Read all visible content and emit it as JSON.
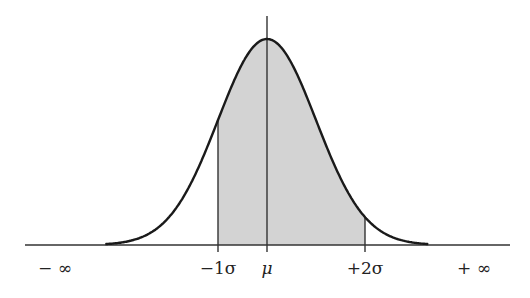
{
  "chart_data": {
    "type": "diagram",
    "distribution": "normal",
    "shaded_range": [
      "-1σ",
      "+2σ"
    ],
    "axis": {
      "labels": [
        {
          "text": "− ∞",
          "position": "left-end"
        },
        {
          "text": "−1σ",
          "position": -1
        },
        {
          "text": "μ",
          "position": 0
        },
        {
          "text": "+2σ",
          "position": 2
        },
        {
          "text": "+ ∞",
          "position": "right-end"
        }
      ],
      "vertical_lines_at": [
        -1,
        0,
        2
      ]
    },
    "colors": {
      "curve": "#1a1a1a",
      "fill": "#d3d3d3",
      "axis": "#333333"
    },
    "geometry": {
      "baseline_y": 245,
      "mu_x": 267,
      "sigma_px": 49,
      "peak_y": 39,
      "axis_x_start": 25,
      "axis_x_end": 510,
      "mu_line_top": 16,
      "tick_bottom": 252
    }
  },
  "labels": {
    "neg_inf": "− ∞",
    "neg1sigma": "−1σ",
    "mu": "μ",
    "pos2sigma": "+2σ",
    "pos_inf": "+ ∞"
  }
}
